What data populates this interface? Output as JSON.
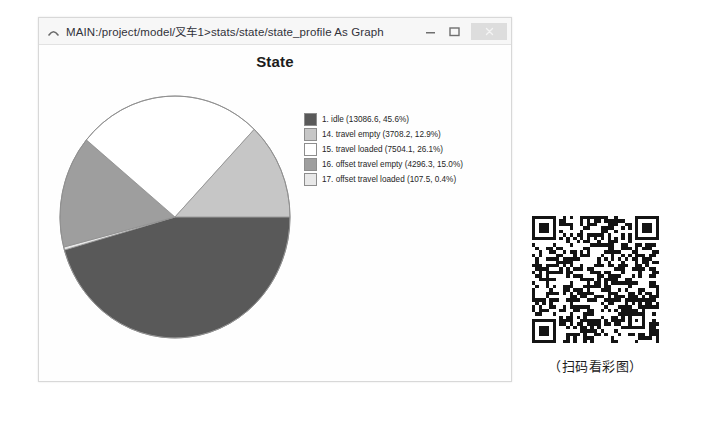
{
  "window": {
    "title": "MAIN:/project/model/叉车1>stats/state/state_profile As Graph",
    "caret_icon": "caret-up-icon",
    "controls": {
      "minimize": "minimize-icon",
      "maximize": "maximize-icon",
      "close": "close-icon"
    }
  },
  "chart_data": {
    "type": "pie",
    "title": "State",
    "legend_position": "right",
    "categories": [
      "1. idle",
      "14. travel empty",
      "15. travel loaded",
      "16. offset travel empty",
      "17. offset travel loaded"
    ],
    "values": [
      13086.6,
      3708.2,
      7504.1,
      4296.3,
      107.5
    ],
    "percents": [
      45.6,
      12.9,
      26.1,
      15.0,
      0.4
    ],
    "colors": [
      "#595959",
      "#c6c6c6",
      "#ffffff",
      "#9e9e9e",
      "#e8e8e8"
    ],
    "slice_order": [
      "1. idle",
      "17. offset travel loaded",
      "16. offset travel empty",
      "15. travel loaded",
      "14. travel empty"
    ],
    "legend_entries": [
      {
        "label": "1. idle (13086.6, 45.6%)",
        "color": "#595959"
      },
      {
        "label": "14. travel empty (3708.2, 12.9%)",
        "color": "#c6c6c6"
      },
      {
        "label": "15. travel loaded (7504.1, 26.1%)",
        "color": "#ffffff"
      },
      {
        "label": "16. offset travel empty (4296.3, 15.0%)",
        "color": "#9e9e9e"
      },
      {
        "label": "17. offset travel loaded (107.5, 0.4%)",
        "color": "#e8e8e8"
      }
    ]
  },
  "qr": {
    "caption": "（扫码看彩图）",
    "alt": "qr-code"
  }
}
